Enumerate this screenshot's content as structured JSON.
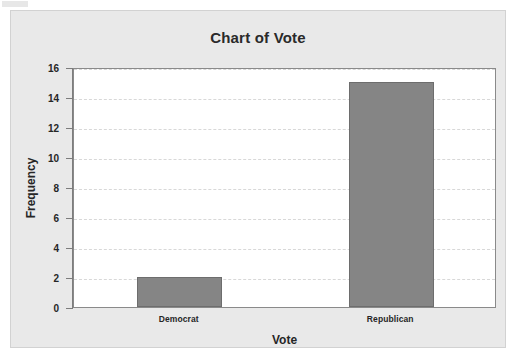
{
  "chart_data": {
    "type": "bar",
    "title": "Chart of Vote",
    "xlabel": "Vote",
    "ylabel": "Frequency",
    "categories": [
      "Democrat",
      "Republican"
    ],
    "values": [
      2,
      15
    ],
    "ylim": [
      0,
      16
    ],
    "yticks": [
      0,
      2,
      4,
      6,
      8,
      10,
      12,
      14,
      16
    ],
    "ytick_labels": [
      "0",
      "2",
      "4",
      "6",
      "8",
      "10",
      "12",
      "14",
      "16"
    ],
    "grid": true,
    "grid_axis": "y",
    "legend": false,
    "bar_color": "#858585",
    "bar_edge_color": "#6d6d6d",
    "plot_background": "#ffffff",
    "figure_background": "#e9e9e9",
    "gridline_color": "#d8d8d8",
    "axis_color": "#8a8a8a"
  }
}
